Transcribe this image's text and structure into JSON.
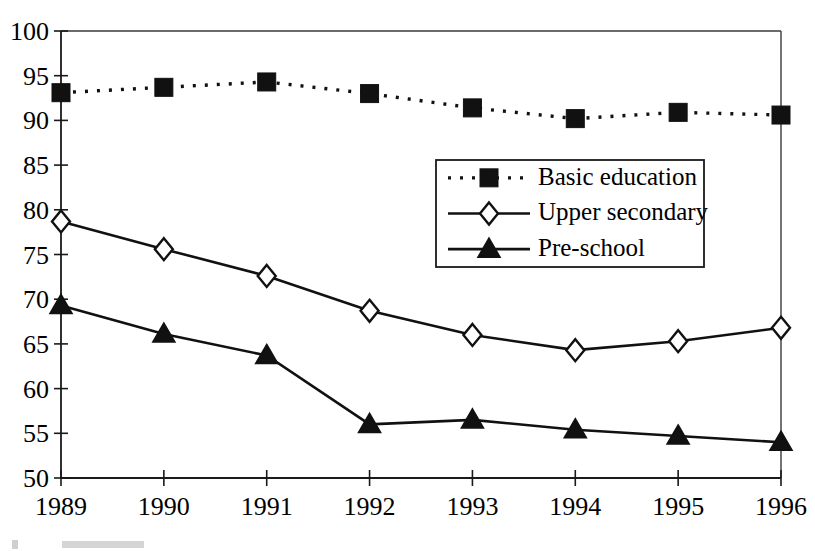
{
  "chart_data": {
    "type": "line",
    "title": "",
    "subtitle": "",
    "xlabel": "",
    "ylabel": "",
    "categories": [
      "1989",
      "1990",
      "1991",
      "1992",
      "1993",
      "1994",
      "1995",
      "1996"
    ],
    "x": [
      1989,
      1990,
      1991,
      1992,
      1993,
      1994,
      1995,
      1996
    ],
    "xlim": [
      1989,
      1996
    ],
    "ylim": [
      50,
      100
    ],
    "y_ticks": [
      50,
      55,
      60,
      65,
      70,
      75,
      80,
      85,
      90,
      95,
      100
    ],
    "y_tick_labels": [
      "50",
      "55",
      "60",
      "65",
      "70",
      "75",
      "80",
      "85",
      "90",
      "95",
      "100"
    ],
    "x_ticks": [
      1989,
      1990,
      1991,
      1992,
      1993,
      1994,
      1995,
      1996
    ],
    "x_tick_labels": [
      "1989",
      "1990",
      "1991",
      "1992",
      "1993",
      "1994",
      "1995",
      "1996"
    ],
    "grid": false,
    "legend_position": "center-right-upper",
    "series": [
      {
        "name": "Basic education",
        "marker": "filled-square",
        "line_style": "dotted",
        "color": "#111111",
        "values": [
          93.1,
          93.7,
          94.3,
          93.0,
          91.4,
          90.2,
          90.9,
          90.6
        ]
      },
      {
        "name": "Upper secondary",
        "marker": "open-diamond",
        "line_style": "solid",
        "color": "#111111",
        "values": [
          78.7,
          75.6,
          72.6,
          68.7,
          66.0,
          64.3,
          65.3,
          66.8
        ]
      },
      {
        "name": "Pre-school",
        "marker": "filled-triangle",
        "line_style": "solid",
        "color": "#111111",
        "values": [
          69.3,
          66.1,
          63.7,
          56.0,
          56.5,
          55.4,
          54.7,
          54.0
        ]
      }
    ]
  },
  "legend": {
    "entries": [
      {
        "label": "Basic education"
      },
      {
        "label": "Upper secondary"
      },
      {
        "label": "Pre-school"
      }
    ]
  },
  "colors": {
    "ink": "#111111",
    "frame": "#3a3a3a",
    "background": "#ffffff"
  }
}
